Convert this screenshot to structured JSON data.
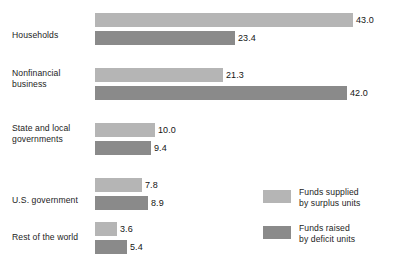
{
  "chart_data": {
    "type": "bar",
    "orientation": "horizontal",
    "title": "",
    "subtitle": "",
    "xlabel": "",
    "ylabel": "",
    "grid": false,
    "xlim": [
      0,
      43.0
    ],
    "legend_position": "bottom-right",
    "categories": [
      "Households",
      "Nonfinancial business",
      "State and local governments",
      "U.S. government",
      "Rest of the world"
    ],
    "series": [
      {
        "name": "Funds supplied by surplus units",
        "color": "#b5b5b5",
        "values": [
          43.0,
          21.3,
          10.0,
          7.8,
          3.6
        ]
      },
      {
        "name": "Funds raised by deficit units",
        "color": "#8a8a8a",
        "values": [
          23.4,
          42.0,
          9.4,
          8.9,
          5.4
        ]
      }
    ],
    "data_labels": [
      [
        "43.0",
        "23.4"
      ],
      [
        "21.3",
        "42.0"
      ],
      [
        "10.0",
        "9.4"
      ],
      [
        "7.8",
        "8.9"
      ],
      [
        "3.6",
        "5.4"
      ]
    ]
  },
  "categories": [
    {
      "lines": [
        "Households"
      ]
    },
    {
      "lines": [
        "Nonfinancial",
        "business"
      ]
    },
    {
      "lines": [
        "State and local",
        "governments"
      ]
    },
    {
      "lines": [
        "U.S. government"
      ]
    },
    {
      "lines": [
        "Rest of  the world"
      ]
    }
  ],
  "legend": {
    "items": [
      {
        "lines": [
          "Funds supplied",
          "by surplus units"
        ],
        "color": "#b5b5b5"
      },
      {
        "lines": [
          "Funds raised",
          "by deficit units"
        ],
        "color": "#8a8a8a"
      }
    ]
  },
  "colors": {
    "supplied": "#b5b5b5",
    "raised": "#8a8a8a",
    "background": "#ffffff",
    "text": "#1c1c1c"
  }
}
